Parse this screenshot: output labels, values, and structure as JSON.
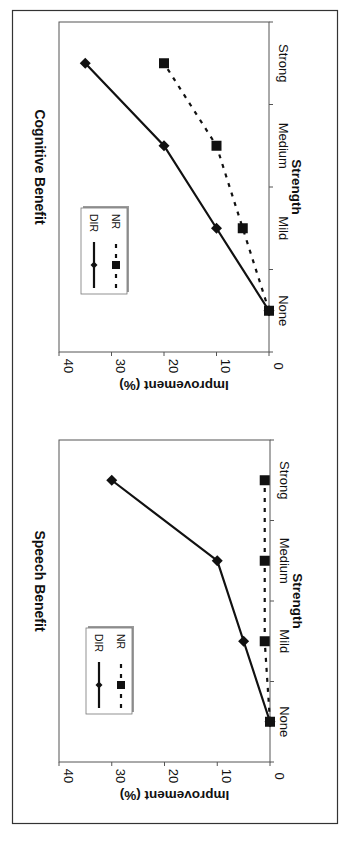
{
  "chart_data": [
    {
      "type": "line",
      "title": "Cognitive Benefit",
      "xlabel": "Strength",
      "ylabel": "Improvement (%)",
      "categories": [
        "None",
        "Mild",
        "Medium",
        "Strong"
      ],
      "ylim": [
        0,
        40
      ],
      "yticks": [
        "0",
        "10",
        "20",
        "30",
        "40"
      ],
      "orientation": "rotated 90° clockwise",
      "legend": {
        "placement": "inside upper-left",
        "entries": [
          "DIR",
          "NR"
        ]
      },
      "series": [
        {
          "name": "DIR",
          "style": "solid",
          "marker": "diamond",
          "values": [
            0,
            10,
            20,
            35
          ]
        },
        {
          "name": "NR",
          "style": "dashed",
          "marker": "square",
          "values": [
            0,
            5,
            10,
            20
          ]
        }
      ]
    },
    {
      "type": "line",
      "title": "Speech Benefit",
      "xlabel": "Strength",
      "ylabel": "Improvement (%)",
      "categories": [
        "None",
        "Mild",
        "Medium",
        "Strong"
      ],
      "ylim": [
        0,
        40
      ],
      "yticks": [
        "0",
        "10",
        "20",
        "30",
        "40"
      ],
      "orientation": "rotated 90° clockwise",
      "legend": {
        "placement": "inside upper-left",
        "entries": [
          "DIR",
          "NR"
        ]
      },
      "series": [
        {
          "name": "DIR",
          "style": "solid",
          "marker": "diamond",
          "values": [
            0,
            5,
            10,
            30
          ]
        },
        {
          "name": "NR",
          "style": "dashed",
          "marker": "square",
          "values": [
            0,
            1,
            1,
            1
          ]
        }
      ]
    }
  ],
  "colors": {
    "line": "#111111",
    "frame": "#333333",
    "legend_shadow": "#9a9a9a"
  }
}
